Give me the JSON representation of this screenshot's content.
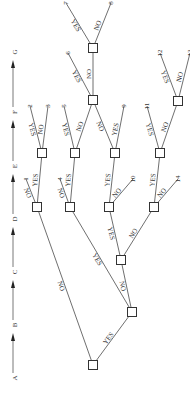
{
  "diagram": {
    "type": "decision-tree",
    "orientation": "rotated-90-ccw",
    "stages": [
      "A",
      "B",
      "C",
      "D",
      "E",
      "F",
      "G"
    ],
    "nodes": [
      {
        "id": "nA",
        "stage": "A"
      },
      {
        "id": "nB",
        "stage": "B"
      },
      {
        "id": "nC",
        "stage": "C"
      },
      {
        "id": "nD1",
        "stage": "D"
      },
      {
        "id": "nD2",
        "stage": "D"
      },
      {
        "id": "nD3",
        "stage": "D"
      },
      {
        "id": "nD4",
        "stage": "D"
      },
      {
        "id": "nE1",
        "stage": "E"
      },
      {
        "id": "nE2",
        "stage": "E"
      },
      {
        "id": "nE3",
        "stage": "E"
      },
      {
        "id": "nE4",
        "stage": "E"
      },
      {
        "id": "nF1",
        "stage": "F"
      },
      {
        "id": "nF2",
        "stage": "F"
      },
      {
        "id": "nG1",
        "stage": "G"
      }
    ],
    "edges": [
      {
        "from": "nA",
        "to": "nB",
        "label": "YES"
      },
      {
        "from": "nA",
        "to": "nD1",
        "label": "NO"
      },
      {
        "from": "nB",
        "to": "nD2",
        "label": "YES"
      },
      {
        "from": "nB",
        "to": "nC",
        "label": "NO"
      },
      {
        "from": "nC",
        "to": "nD3",
        "label": "YES"
      },
      {
        "from": "nC",
        "to": "nD4",
        "label": "NO"
      },
      {
        "from": "nD1",
        "to": "t1",
        "label": "NO"
      },
      {
        "from": "nD1",
        "to": "nE1",
        "label": "YES"
      },
      {
        "from": "nD2",
        "to": "t4",
        "label": "NO"
      },
      {
        "from": "nD2",
        "to": "nE2",
        "label": "YES"
      },
      {
        "from": "nD3",
        "to": "nE3",
        "label": "YES"
      },
      {
        "from": "nD3",
        "to": "t10",
        "label": "NO"
      },
      {
        "from": "nD4",
        "to": "nE4",
        "label": "YES"
      },
      {
        "from": "nD4",
        "to": "t14",
        "label": "NO"
      },
      {
        "from": "nE1",
        "to": "t2",
        "label": "YES"
      },
      {
        "from": "nE1",
        "to": "t3",
        "label": "NO"
      },
      {
        "from": "nE2",
        "to": "t5",
        "label": "YES"
      },
      {
        "from": "nE2",
        "to": "nF1",
        "label": "NO"
      },
      {
        "from": "nE3",
        "to": "nF1",
        "label": "NO"
      },
      {
        "from": "nE3",
        "to": "t9",
        "label": "YES"
      },
      {
        "from": "nE4",
        "to": "t11",
        "label": "YES"
      },
      {
        "from": "nE4",
        "to": "nF2",
        "label": "NO"
      },
      {
        "from": "nF1",
        "to": "t6",
        "label": "YES"
      },
      {
        "from": "nF1",
        "to": "nG1",
        "label": "NO"
      },
      {
        "from": "nF2",
        "to": "t12",
        "label": "YES"
      },
      {
        "from": "nF2",
        "to": "t13",
        "label": "NO"
      },
      {
        "from": "nG1",
        "to": "t7",
        "label": "YES"
      },
      {
        "from": "nG1",
        "to": "t8",
        "label": "NO"
      }
    ],
    "terminals": [
      {
        "id": "t1",
        "label": "1"
      },
      {
        "id": "t2",
        "label": "2"
      },
      {
        "id": "t3",
        "label": "3"
      },
      {
        "id": "t4",
        "label": "4"
      },
      {
        "id": "t5",
        "label": "5"
      },
      {
        "id": "t6",
        "label": "6"
      },
      {
        "id": "t7",
        "label": "7"
      },
      {
        "id": "t8",
        "label": "8"
      },
      {
        "id": "t9",
        "label": "9"
      },
      {
        "id": "t10",
        "label": "10"
      },
      {
        "id": "t11",
        "label": "11"
      },
      {
        "id": "t12",
        "label": "12"
      },
      {
        "id": "t13",
        "label": "13"
      },
      {
        "id": "t14",
        "label": "14"
      }
    ]
  }
}
